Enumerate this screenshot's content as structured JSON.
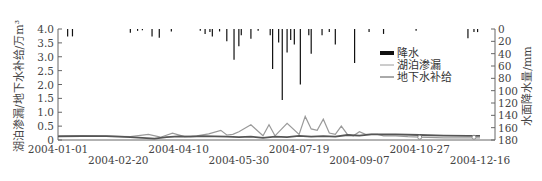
{
  "chart_data": {
    "type": "line",
    "title": "",
    "x_tick_labels": [
      "2004-01-01",
      "2004-02-20",
      "2004-04-10",
      "2004-05-30",
      "2004-07-19",
      "2004-09-07",
      "2004-10-27",
      "2004-12-16"
    ],
    "ylabel_left": "湖泊渗漏/地下水补给/万m³",
    "ylabel_right": "水面降水量/mm",
    "yticks_left": [
      "4.0",
      "3.5",
      "3.0",
      "2.5",
      "2.0",
      "1.5",
      "1.0",
      "0.5",
      "0"
    ],
    "yticks_right": [
      "0",
      "20",
      "40",
      "60",
      "80",
      "100",
      "120",
      "140",
      "160",
      "180"
    ],
    "ylim_left": [
      0,
      4.0
    ],
    "ylim_right": [
      180,
      0
    ],
    "grid": false,
    "legend": [
      {
        "name": "降水",
        "style": "bar",
        "color": "#111111"
      },
      {
        "name": "湖泊渗漏",
        "style": "line",
        "color": "#9a9a9a"
      },
      {
        "name": "地下水补给",
        "style": "line",
        "color": "#555555"
      }
    ],
    "legend_position": "right-middle inside",
    "series": [
      {
        "name": "降水",
        "type": "bar",
        "axis": "right",
        "unit": "mm",
        "days": [
          8,
          12,
          60,
          66,
          70,
          78,
          84,
          94,
          118,
          122,
          126,
          128,
          134,
          140,
          146,
          150,
          152,
          160,
          166,
          176,
          178,
          183,
          186,
          190,
          193,
          196,
          201,
          208,
          210,
          219,
          225,
          230,
          246,
          258,
          270,
          297,
          340,
          345,
          348
        ],
        "values": [
          12,
          12,
          6,
          3,
          2,
          12,
          14,
          4,
          3,
          8,
          5,
          12,
          4,
          20,
          50,
          28,
          10,
          16,
          3,
          10,
          65,
          22,
          115,
          38,
          18,
          25,
          90,
          10,
          40,
          10,
          5,
          25,
          55,
          5,
          8,
          3,
          15,
          5,
          5
        ]
      },
      {
        "name": "湖泊渗漏",
        "type": "line",
        "axis": "left",
        "unit": "万m³",
        "days": [
          0,
          20,
          40,
          60,
          75,
          85,
          95,
          105,
          115,
          125,
          135,
          140,
          145,
          150,
          160,
          170,
          175,
          180,
          190,
          200,
          205,
          210,
          215,
          220,
          225,
          230,
          235,
          240,
          245,
          250,
          255,
          260,
          265,
          270,
          280,
          290,
          300,
          320,
          340,
          350
        ],
        "values": [
          0.15,
          0.16,
          0.14,
          0.12,
          0.2,
          0.1,
          0.25,
          0.12,
          0.15,
          0.22,
          0.35,
          0.18,
          0.2,
          0.3,
          0.55,
          0.15,
          0.55,
          0.15,
          0.6,
          0.2,
          0.85,
          0.4,
          0.35,
          0.75,
          0.25,
          0.2,
          0.5,
          0.2,
          0.15,
          0.3,
          0.2,
          0.2,
          0.2,
          0.15,
          0.15,
          0.12,
          0.1,
          0.08,
          0.08,
          0.08
        ]
      },
      {
        "name": "地下水补给",
        "type": "line",
        "axis": "left",
        "unit": "万m³",
        "days": [
          0,
          20,
          40,
          60,
          80,
          90,
          100,
          110,
          120,
          130,
          140,
          150,
          160,
          170,
          180,
          190,
          200,
          210,
          220,
          230,
          240,
          250,
          260,
          280,
          300,
          320,
          340,
          350
        ],
        "values": [
          0.13,
          0.14,
          0.14,
          0.1,
          0.05,
          0.1,
          0.13,
          0.12,
          0.14,
          0.13,
          0.12,
          0.1,
          0.12,
          0.08,
          0.12,
          0.1,
          0.15,
          0.12,
          0.14,
          0.12,
          0.18,
          0.16,
          0.2,
          0.2,
          0.18,
          0.16,
          0.15,
          0.15
        ]
      }
    ]
  },
  "axes": {
    "x_tick_labels": [
      "2004-01-01",
      "2004-02-20",
      "2004-04-10",
      "2004-05-30",
      "2004-07-19",
      "2004-09-07",
      "2004-10-27",
      "2004-12-16"
    ],
    "left_ticks": [
      "4.0",
      "3.5",
      "3.0",
      "2.5",
      "2.0",
      "1.5",
      "1.0",
      "0.5",
      "0"
    ],
    "right_ticks": [
      "0",
      "20",
      "40",
      "60",
      "80",
      "100",
      "120",
      "140",
      "160",
      "180"
    ],
    "left_title": "湖泊渗漏/地下水补给/万m³",
    "right_title": "水面降水量/mm"
  },
  "legend": {
    "items": [
      {
        "label": "降水"
      },
      {
        "label": "湖泊渗漏"
      },
      {
        "label": "地下水补给"
      }
    ]
  },
  "colors": {
    "precip": "#111111",
    "leakage": "#9a9a9a",
    "recharge": "#555555",
    "axis": "#666666"
  }
}
